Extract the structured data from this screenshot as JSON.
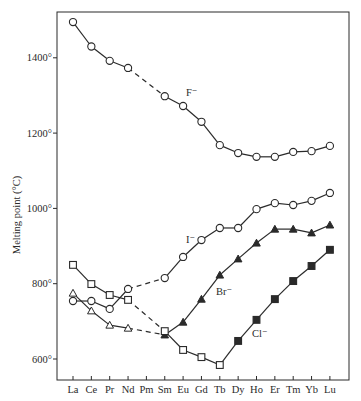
{
  "chart_data": {
    "type": "line",
    "title": "",
    "xlabel": "",
    "ylabel": "Melting point (°C)",
    "ylim": [
      560,
      1540
    ],
    "yticks": [
      600,
      800,
      1000,
      1200,
      1400
    ],
    "ytick_labels": [
      "600°",
      "800°",
      "1000°",
      "1200°",
      "1400°"
    ],
    "categories": [
      "La",
      "Ce",
      "Pr",
      "Nd",
      "Pm",
      "Sm",
      "Eu",
      "Gd",
      "Tb",
      "Dy",
      "Ho",
      "Er",
      "Tm",
      "Yb",
      "Lu"
    ],
    "grid": false,
    "legend": "inline labels next to curves",
    "dashed_segment": "Nd to Sm (no data for Pm)",
    "series": [
      {
        "name": "F⁻",
        "label": "F⁻",
        "marker": "open-circle",
        "values": [
          1495,
          1430,
          1392,
          1373,
          null,
          1298,
          1272,
          1230,
          1168,
          1147,
          1137,
          1137,
          1150,
          1152,
          1166
        ]
      },
      {
        "name": "I⁻",
        "label": "I⁻",
        "marker": "open-circle",
        "values": [
          754,
          754,
          733,
          786,
          null,
          815,
          871,
          916,
          948,
          948,
          998,
          1014,
          1009,
          1020,
          1041
        ]
      },
      {
        "name": "Br⁻",
        "label": "Br⁻",
        "marker": "triangle (open La–Nd, filled Sm–Lu)",
        "filled_from_index": 5,
        "values": [
          775,
          728,
          690,
          682,
          null,
          664,
          698,
          759,
          823,
          866,
          908,
          945,
          945,
          935,
          956
        ]
      },
      {
        "name": "Cl⁻",
        "label": "Cl⁻",
        "marker": "square (open La–Tb, filled Dy–Lu)",
        "filled_from_index": 9,
        "values": [
          850,
          799,
          770,
          757,
          null,
          674,
          624,
          605,
          584,
          648,
          704,
          759,
          807,
          847,
          890
        ]
      }
    ]
  },
  "colors": {
    "ink": "#2a2a2a",
    "background": "#ffffff"
  }
}
